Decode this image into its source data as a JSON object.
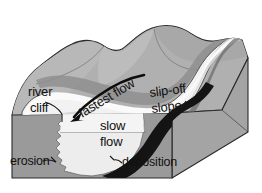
{
  "diagram": {
    "background_color": "#ffffff",
    "labels": {
      "river_cliff_line1": "river",
      "river_cliff_line2": "cliff",
      "fastest_flow": "fastest flow",
      "slip_off_line1": "slip-off",
      "slip_off_line2": "slope",
      "slow_flow_line1": "slow",
      "slow_flow_line2": "flow",
      "erosion": "erosion",
      "deposition": "deposition"
    },
    "colors": {
      "background": "#ffffff",
      "terrain_top": "#b0b0b0",
      "terrain_hill_light": "#bdbdbd",
      "terrain_hill_shade": "#9e9e9e",
      "block_front_face": "#9a9a9a",
      "block_side_face": "#a4a4a4",
      "water_light": "#f2f2f2",
      "water_mid": "#d8d8d8",
      "bank_shadow": "#8c8c8c",
      "bank_dark": "#6e6e6e",
      "deposition_band": "#121212",
      "outline": "#2b2b2b",
      "arrow": "#0d0d0d",
      "text": "#111111"
    },
    "features": [
      {
        "name": "river-cliff",
        "label": "river cliff",
        "description": "Steep outer bank cut by fast flow on the outside of the meander",
        "side": "outer-bank"
      },
      {
        "name": "fastest-flow",
        "label": "fastest flow",
        "description": "Curved arrow showing thalweg swinging to the outside of the bend",
        "side": "outer-bank"
      },
      {
        "name": "slip-off-slope",
        "label": "slip-off slope",
        "description": "Gentle inner bank built up by deposition on the inside of the meander",
        "side": "inner-bank"
      },
      {
        "name": "slow-flow",
        "label": "slow flow",
        "description": "Slower moving water over the shallow inner bend",
        "side": "inner-bank"
      },
      {
        "name": "erosion",
        "label": "erosion",
        "description": "Undercutting of the outer bank shown in cross-section on the front face",
        "side": "outer-bank"
      },
      {
        "name": "deposition",
        "label": "deposition",
        "description": "Sediment laid down on the inner bend forming a point bar",
        "side": "inner-bank"
      }
    ]
  }
}
